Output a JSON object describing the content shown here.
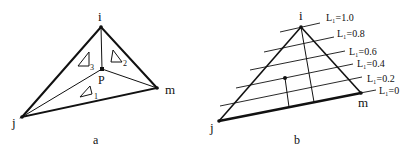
{
  "figure_a": {
    "caption": "a",
    "vertices": {
      "i": "i",
      "j": "j",
      "m": "m",
      "P": "P"
    },
    "subareas": [
      "Δ1",
      "Δ2",
      "Δ3"
    ],
    "subarea_subscripts": [
      "1",
      "2",
      "3"
    ]
  },
  "figure_b": {
    "caption": "b",
    "vertices": {
      "i": "i",
      "j": "j",
      "m": "m"
    },
    "level_lines": [
      {
        "label": "L₁=1.0",
        "value": 1.0
      },
      {
        "label": "L₁=0.8",
        "value": 0.8
      },
      {
        "label": "L₁=0.6",
        "value": 0.6
      },
      {
        "label": "L₁=0.4",
        "value": 0.4
      },
      {
        "label": "L₁=0.2",
        "value": 0.2
      },
      {
        "label": "L₁=0",
        "value": 0.0
      }
    ]
  }
}
